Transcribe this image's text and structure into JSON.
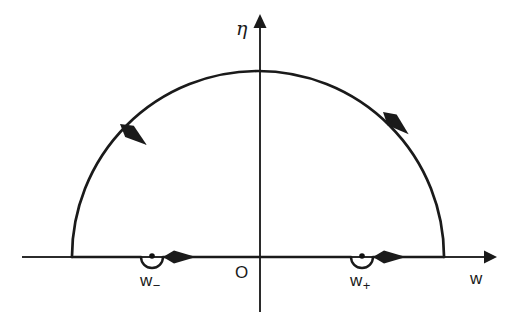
{
  "figure": {
    "background_color": "#ffffff",
    "line_color": "#1a1a1a",
    "axis_color": "#2b2b2b"
  },
  "axes": {
    "horizontal": {
      "label": "w",
      "name": "real-axis",
      "x_start": 22,
      "x_end": 492,
      "y": 257,
      "arrow_at": "right"
    },
    "vertical": {
      "label": "η",
      "name": "imaginary-axis",
      "x": 260,
      "y_top": 18,
      "y_end": 312,
      "arrow_at": "top"
    },
    "origin_label": "O"
  },
  "contour": {
    "type": "semicircle",
    "orientation": "counterclockwise",
    "center_x": 258,
    "center_y": 257,
    "radius": 186,
    "left_endpoint_x": 72,
    "right_endpoint_x": 444,
    "apex_y": 65,
    "arc_arrows": [
      {
        "name": "arc-arrow-left",
        "direction": "down-left",
        "angle_deg": 145
      },
      {
        "name": "arc-arrow-right",
        "direction": "up-left",
        "angle_deg": 42
      }
    ],
    "axis_arrows": [
      {
        "name": "real-axis-arrow-left-segment",
        "x": 180,
        "direction": "right"
      },
      {
        "name": "real-axis-arrow-right-segment",
        "x": 390,
        "direction": "right"
      }
    ]
  },
  "poles": [
    {
      "name": "pole-w-minus",
      "label": "w",
      "subscript": "−",
      "x": 152,
      "y": 257,
      "detour": "below-axis-semicircle",
      "detour_radius": 11
    },
    {
      "name": "pole-w-plus",
      "label": "w",
      "subscript": "+",
      "x": 362,
      "y": 257,
      "detour": "below-axis-semicircle",
      "detour_radius": 11
    }
  ]
}
